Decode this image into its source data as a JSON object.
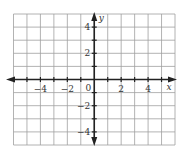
{
  "diagram": {
    "type": "coordinate-grid",
    "x_axis": {
      "label": "x",
      "min": -6,
      "max": 6,
      "tick_labels": [
        "−4",
        "−2",
        "2",
        "4"
      ],
      "tick_values": [
        -4,
        -2,
        2,
        4
      ]
    },
    "y_axis": {
      "label": "y",
      "min": -5,
      "max": 5,
      "tick_labels": [
        "4",
        "2",
        "−2",
        "−4"
      ],
      "tick_values": [
        4,
        2,
        -2,
        -4
      ]
    },
    "origin_label": "0",
    "grid_color": "#a0a0a0",
    "axis_color": "#222222"
  }
}
